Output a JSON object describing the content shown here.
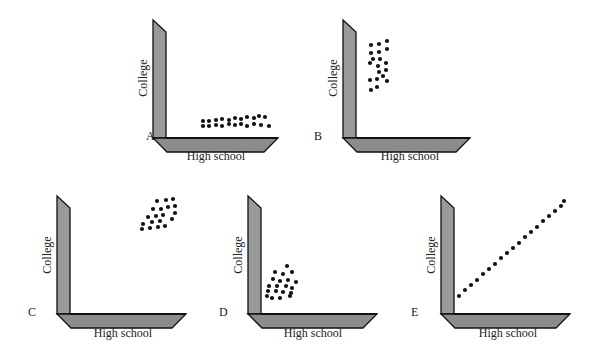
{
  "figure": {
    "colors": {
      "axis_fill_vertical": "#9a9a9a",
      "axis_fill_base": "#8c8c8c",
      "axis_edge": "#111111",
      "dot": "#111111",
      "text": "#222222"
    },
    "panels": [
      {
        "id": "A",
        "label": "A",
        "xlabel": "High school",
        "ylabel": "College",
        "pattern": "clustered low along x-axis, spread horizontally"
      },
      {
        "id": "B",
        "label": "B",
        "xlabel": "High school",
        "ylabel": "College",
        "pattern": "clustered near y-axis, spread vertically"
      },
      {
        "id": "C",
        "label": "C",
        "xlabel": "High school",
        "ylabel": "College",
        "pattern": "cluster at high x, high y"
      },
      {
        "id": "D",
        "label": "D",
        "xlabel": "High school",
        "ylabel": "College",
        "pattern": "cluster at low x, low y"
      },
      {
        "id": "E",
        "label": "E",
        "xlabel": "High school",
        "ylabel": "College",
        "pattern": "perfect positive linear relation"
      }
    ]
  },
  "chart_data": [
    {
      "type": "scatter",
      "title": "A",
      "xlabel": "High school",
      "ylabel": "College",
      "points": [
        [
          203,
          121
        ],
        [
          209,
          121
        ],
        [
          216,
          120
        ],
        [
          222,
          119
        ],
        [
          229,
          120
        ],
        [
          235,
          118
        ],
        [
          241,
          119
        ],
        [
          247,
          117
        ],
        [
          254,
          118
        ],
        [
          259,
          116
        ],
        [
          265,
          117
        ],
        [
          203,
          126
        ],
        [
          209,
          126
        ],
        [
          216,
          125
        ],
        [
          222,
          126
        ],
        [
          229,
          124
        ],
        [
          235,
          125
        ],
        [
          241,
          124
        ],
        [
          247,
          126
        ],
        [
          254,
          124
        ],
        [
          261,
          125
        ],
        [
          269,
          126
        ]
      ]
    },
    {
      "type": "scatter",
      "title": "B",
      "xlabel": "High school",
      "ylabel": "College",
      "points": [
        [
          371,
          45
        ],
        [
          379,
          44
        ],
        [
          387,
          41
        ],
        [
          371,
          53
        ],
        [
          379,
          52
        ],
        [
          387,
          49
        ],
        [
          373,
          59
        ],
        [
          380,
          59
        ],
        [
          370,
          63
        ],
        [
          378,
          66
        ],
        [
          386,
          63
        ],
        [
          379,
          72
        ],
        [
          386,
          70
        ],
        [
          383,
          76
        ],
        [
          370,
          80
        ],
        [
          377,
          79
        ],
        [
          387,
          81
        ],
        [
          371,
          90
        ],
        [
          377,
          87
        ]
      ]
    },
    {
      "type": "scatter",
      "title": "C",
      "xlabel": "High school",
      "ylabel": "College",
      "points": [
        [
          157,
          201
        ],
        [
          166,
          200
        ],
        [
          173,
          199
        ],
        [
          153,
          209
        ],
        [
          161,
          209
        ],
        [
          168,
          207
        ],
        [
          175,
          206
        ],
        [
          148,
          217
        ],
        [
          156,
          216
        ],
        [
          163,
          215
        ],
        [
          175,
          213
        ],
        [
          143,
          224
        ],
        [
          152,
          222
        ],
        [
          160,
          221
        ],
        [
          172,
          219
        ],
        [
          142,
          229
        ],
        [
          150,
          228
        ],
        [
          158,
          227
        ],
        [
          165,
          226
        ]
      ]
    },
    {
      "type": "scatter",
      "title": "D",
      "xlabel": "High school",
      "ylabel": "College",
      "points": [
        [
          287,
          266
        ],
        [
          275,
          272
        ],
        [
          283,
          274
        ],
        [
          292,
          272
        ],
        [
          273,
          279
        ],
        [
          280,
          281
        ],
        [
          288,
          280
        ],
        [
          296,
          282
        ],
        [
          269,
          286
        ],
        [
          277,
          286
        ],
        [
          286,
          286
        ],
        [
          292,
          288
        ],
        [
          268,
          291
        ],
        [
          276,
          291
        ],
        [
          283,
          292
        ],
        [
          291,
          293
        ],
        [
          267,
          296
        ],
        [
          272,
          298
        ],
        [
          280,
          298
        ],
        [
          290,
          296
        ]
      ]
    },
    {
      "type": "scatter",
      "title": "E",
      "xlabel": "High school",
      "ylabel": "College",
      "points": [
        [
          459,
          296
        ],
        [
          465,
          290
        ],
        [
          471,
          285
        ],
        [
          477,
          280
        ],
        [
          483,
          274
        ],
        [
          489,
          269
        ],
        [
          495,
          264
        ],
        [
          501,
          258
        ],
        [
          507,
          253
        ],
        [
          513,
          248
        ],
        [
          519,
          243
        ],
        [
          525,
          237
        ],
        [
          531,
          232
        ],
        [
          537,
          227
        ],
        [
          543,
          221
        ],
        [
          549,
          216
        ],
        [
          555,
          211
        ],
        [
          561,
          206
        ],
        [
          564,
          201
        ]
      ]
    }
  ]
}
